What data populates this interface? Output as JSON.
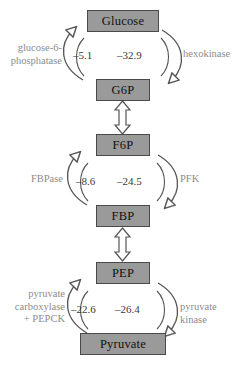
{
  "diagram": {
    "colors": {
      "node_fill": "#9a9a9a",
      "node_stroke": "#4a4a4a",
      "node_text": "#111111",
      "enzyme_text": "#8c8c8c",
      "value_text": "#3a3a3a",
      "arrow_stroke": "#555555",
      "background": "#ffffff"
    },
    "nodes": [
      {
        "id": "glucose",
        "label": "Glucose"
      },
      {
        "id": "g6p",
        "label": "G6P"
      },
      {
        "id": "f6p",
        "label": "F6P"
      },
      {
        "id": "fbp",
        "label": "FBP"
      },
      {
        "id": "pep",
        "label": "PEP"
      },
      {
        "id": "pyruvate",
        "label": "Pyruvate"
      }
    ],
    "cycles": [
      {
        "id": "cycle-glucose-g6p",
        "top_node": "Glucose",
        "bottom_node": "G6P",
        "left_enzyme": "glucose-6-\nphosphatase",
        "right_enzyme": "hexokinase",
        "left_value": "–5.1",
        "right_value": "–32.9"
      },
      {
        "id": "cycle-f6p-fbp",
        "top_node": "F6P",
        "bottom_node": "FBP",
        "left_enzyme": "FBPase",
        "right_enzyme": "PFK",
        "left_value": "–8.6",
        "right_value": "–24.5"
      },
      {
        "id": "cycle-pep-pyruvate",
        "top_node": "PEP",
        "bottom_node": "Pyruvate",
        "left_enzyme": "pyruvate\ncarboxylase\n+ PEPCK",
        "right_enzyme": "pyruvate kinase",
        "left_value": "–22.6",
        "right_value": "–26.4"
      }
    ],
    "connectors": [
      {
        "id": "connector-g6p-f6p",
        "from": "G6P",
        "to": "F6P",
        "type": "double-headed-block-arrow"
      },
      {
        "id": "connector-fbp-pep",
        "from": "FBP",
        "to": "PEP",
        "type": "double-headed-block-arrow"
      }
    ]
  }
}
